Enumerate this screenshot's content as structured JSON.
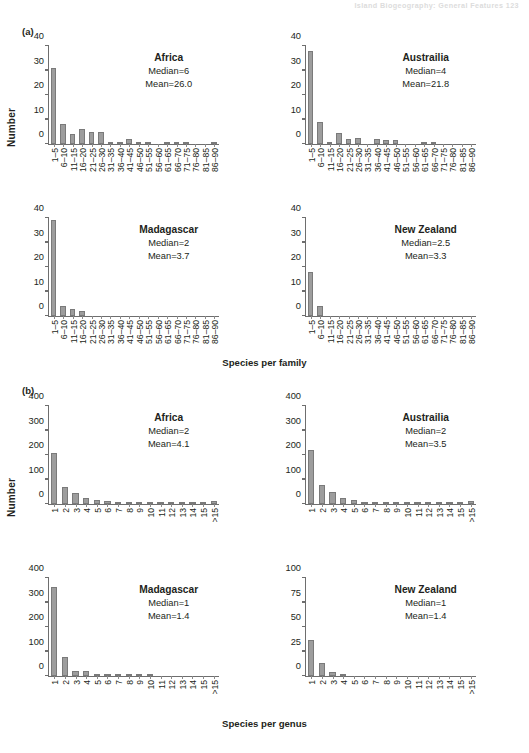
{
  "running_head": "Island Biogeography: General Features     123",
  "panels": {
    "a": {
      "letter": "(a)",
      "ylabel": "Number",
      "xcaption": "Species per family"
    },
    "b": {
      "letter": "(b)",
      "ylabel": "Number",
      "xcaption": "Species per genus"
    }
  },
  "chart_data": [
    {
      "type": "bar",
      "panel": "a",
      "title": "Africa",
      "subtitle_median": "Median=6",
      "subtitle_mean": "Mean=26.0",
      "xlabel": "Species per family",
      "ylabel": "Number",
      "ylim": [
        0,
        40
      ],
      "yticks": [
        0,
        10,
        20,
        30,
        40
      ],
      "grid": false,
      "categories": [
        "1–5",
        "6–10",
        "11–15",
        "16–20",
        "21–25",
        "26–30",
        "31–35",
        "36–40",
        "41–45",
        "46–50",
        "51–55",
        "56–60",
        "61–65",
        "66–70",
        "71–75",
        "76–80",
        "81–85",
        "86–90"
      ],
      "values": [
        31,
        8,
        4,
        6,
        5,
        5,
        1,
        1,
        2,
        1,
        1,
        0,
        1,
        1,
        1,
        0,
        0,
        1
      ]
    },
    {
      "type": "bar",
      "panel": "a",
      "title": "Austrailia",
      "subtitle_median": "Median=4",
      "subtitle_mean": "Mean=21.8",
      "xlabel": "Species per family",
      "ylabel": "Number",
      "ylim": [
        0,
        40
      ],
      "yticks": [
        0,
        10,
        20,
        30,
        40
      ],
      "grid": false,
      "categories": [
        "1–5",
        "6–10",
        "11–15",
        "16–20",
        "21–25",
        "26–30",
        "31–35",
        "36–40",
        "41–45",
        "46–50",
        "51–55",
        "56–60",
        "61–65",
        "66–70",
        "71–75",
        "76–80",
        "81–85",
        "86–90"
      ],
      "values": [
        38,
        9,
        1,
        4.5,
        2,
        2.5,
        0,
        2,
        1.5,
        1.5,
        0,
        0,
        1,
        1,
        0,
        0,
        0,
        0
      ]
    },
    {
      "type": "bar",
      "panel": "a",
      "title": "Madagascar",
      "subtitle_median": "Median=2",
      "subtitle_mean": "Mean=3.7",
      "xlabel": "Species per family",
      "ylabel": "Number",
      "ylim": [
        0,
        40
      ],
      "yticks": [
        0,
        10,
        20,
        30,
        40
      ],
      "grid": false,
      "categories": [
        "1–5",
        "6–10",
        "11–15",
        "16–20",
        "21–25",
        "26–30",
        "31–35",
        "36–40",
        "41–45",
        "46–50",
        "51–55",
        "56–60",
        "61–65",
        "66–70",
        "71–75",
        "76–80",
        "81–85",
        "86–90"
      ],
      "values": [
        39,
        4,
        3,
        2,
        0,
        0,
        0,
        0,
        0,
        0,
        0,
        0,
        0,
        0,
        0,
        0,
        0,
        0
      ]
    },
    {
      "type": "bar",
      "panel": "a",
      "title": "New Zealand",
      "subtitle_median": "Median=2.5",
      "subtitle_mean": "Mean=3.3",
      "xlabel": "Species per family",
      "ylabel": "Number",
      "ylim": [
        0,
        40
      ],
      "yticks": [
        0,
        10,
        20,
        30,
        40
      ],
      "grid": false,
      "categories": [
        "1–5",
        "6–10",
        "11–15",
        "16–20",
        "21–25",
        "26–30",
        "31–35",
        "36–40",
        "41–45",
        "46–50",
        "51–55",
        "56–60",
        "61–65",
        "66–70",
        "71–75",
        "76–80",
        "81–85",
        "86–90"
      ],
      "values": [
        18,
        4,
        0,
        0,
        0,
        0,
        0,
        0,
        0,
        0,
        0,
        0,
        0,
        0,
        0,
        0,
        0,
        0
      ]
    },
    {
      "type": "bar",
      "panel": "b",
      "title": "Africa",
      "subtitle_median": "Median=2",
      "subtitle_mean": "Mean=4.1",
      "xlabel": "Species per genus",
      "ylabel": "Number",
      "ylim": [
        0,
        400
      ],
      "yticks": [
        0,
        100,
        200,
        300,
        400
      ],
      "grid": false,
      "categories": [
        "1",
        "2",
        "3",
        "4",
        "5",
        "6",
        "7",
        "8",
        "9",
        "10",
        "11",
        "12",
        "13",
        "14",
        "15",
        ">15"
      ],
      "values": [
        210,
        70,
        45,
        25,
        15,
        12,
        8,
        5,
        5,
        3,
        3,
        3,
        2,
        2,
        2,
        12
      ]
    },
    {
      "type": "bar",
      "panel": "b",
      "title": "Austrailia",
      "subtitle_median": "Median=2",
      "subtitle_mean": "Mean=3.5",
      "xlabel": "Species per genus",
      "ylabel": "Number",
      "ylim": [
        0,
        400
      ],
      "yticks": [
        0,
        100,
        200,
        300,
        400
      ],
      "grid": false,
      "categories": [
        "1",
        "2",
        "3",
        "4",
        "5",
        "6",
        "7",
        "8",
        "9",
        "10",
        "11",
        "12",
        "13",
        "14",
        "15",
        ">15"
      ],
      "values": [
        220,
        78,
        50,
        25,
        18,
        10,
        4,
        4,
        4,
        3,
        3,
        2,
        2,
        2,
        2,
        12
      ]
    },
    {
      "type": "bar",
      "panel": "b",
      "title": "Madagascar",
      "subtitle_median": "Median=1",
      "subtitle_mean": "Mean=1.4",
      "xlabel": "Species per genus",
      "ylabel": "Number",
      "ylim": [
        0,
        400
      ],
      "yticks": [
        0,
        100,
        200,
        300,
        400
      ],
      "grid": false,
      "categories": [
        "1",
        "2",
        "3",
        "4",
        "5",
        "6",
        "7",
        "8",
        "9",
        "10",
        "11",
        "12",
        "13",
        "14",
        "15",
        ">15"
      ],
      "values": [
        365,
        78,
        22,
        22,
        10,
        2,
        2,
        2,
        2,
        6,
        0,
        0,
        0,
        0,
        0,
        0
      ]
    },
    {
      "type": "bar",
      "panel": "b",
      "title": "New Zealand",
      "subtitle_median": "Median=1",
      "subtitle_mean": "Mean=1.4",
      "xlabel": "Species per genus",
      "ylabel": "Number",
      "ylim": [
        0,
        100
      ],
      "yticks": [
        0,
        25,
        50,
        75,
        100
      ],
      "grid": false,
      "categories": [
        "1",
        "2",
        "3",
        "4",
        "5",
        "6",
        "7",
        "8",
        "9",
        "10",
        "11",
        "12",
        "13",
        "14",
        "15",
        ">15"
      ],
      "values": [
        37,
        13,
        4,
        2,
        0,
        0,
        0,
        0,
        0,
        0,
        0,
        0,
        0,
        0,
        0,
        0
      ]
    }
  ]
}
